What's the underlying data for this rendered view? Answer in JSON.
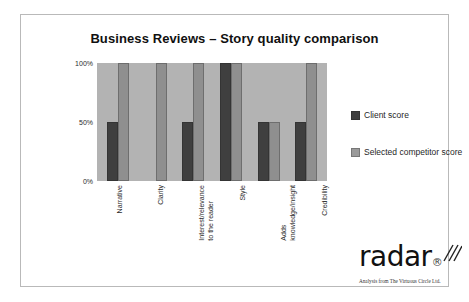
{
  "chart_data": {
    "type": "bar",
    "title": "Business Reviews – Story quality comparison",
    "xlabel": "",
    "ylabel": "",
    "ylim": [
      0,
      100
    ],
    "yticks": [
      "0%",
      "50%",
      "100%"
    ],
    "ytick_values": [
      0,
      50,
      100
    ],
    "grid": false,
    "legend_position": "right",
    "categories": [
      "Narrative",
      "Clarity",
      "Interest/relevance to the reader",
      "Style",
      "Adds knowledge/insight",
      "Credibility"
    ],
    "category_lines": [
      [
        "Narrative",
        ""
      ],
      [
        "Clarity",
        ""
      ],
      [
        "Interest/relevance",
        "to the reader"
      ],
      [
        "Style",
        ""
      ],
      [
        "Adds",
        "knowledge/insight"
      ],
      [
        "Credibility",
        ""
      ]
    ],
    "series": [
      {
        "name": "Client score",
        "color": "#3f3f3f",
        "values": [
          50,
          0,
          50,
          100,
          50,
          50
        ]
      },
      {
        "name": "Selected competitor score",
        "color": "#8f8f8f",
        "values": [
          100,
          100,
          100,
          100,
          50,
          100
        ]
      }
    ]
  },
  "legend": {
    "items": [
      {
        "label": "Client score",
        "color": "#3f3f3f"
      },
      {
        "label": "Selected competitor score",
        "color": "#9a9a9a"
      }
    ]
  },
  "logo": {
    "wordmark": "radar",
    "registered_mark": "®",
    "tagline": "Analysis from The Virtuous Circle Ltd."
  }
}
